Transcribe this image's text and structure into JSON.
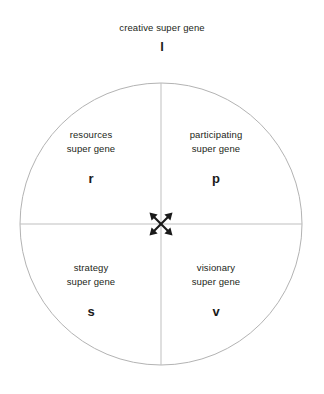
{
  "diagram": {
    "top": {
      "title": "creative super gene",
      "letter": "l"
    },
    "center_icon": "four-way-arrow-icon",
    "quadrants": [
      {
        "position": "top-left",
        "line1": "resources",
        "line2": "super gene",
        "letter": "r"
      },
      {
        "position": "top-right",
        "line1": "participating",
        "line2": "super gene",
        "letter": "p"
      },
      {
        "position": "bottom-left",
        "line1": "strategy",
        "line2": "super gene",
        "letter": "s"
      },
      {
        "position": "bottom-right",
        "line1": "visionary",
        "line2": "super gene",
        "letter": "v"
      }
    ],
    "colors": {
      "background": "#ffffff",
      "text": "#231f20",
      "letter": "#1a1a1a",
      "circle_stroke": "#b3b3b3",
      "axis_stroke": "#bfbfbf",
      "icon_fill": "#1a1a1a"
    },
    "geometry": {
      "circle_center_x": 161,
      "circle_center_y": 224,
      "circle_radius": 141
    }
  }
}
